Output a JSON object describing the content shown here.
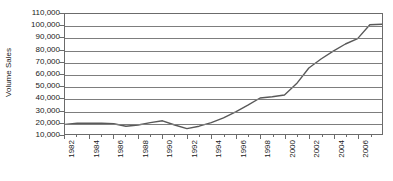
{
  "chart_data": {
    "type": "line",
    "title": "",
    "subtitle": "",
    "xlabel": "",
    "ylabel": "Volume Sales",
    "xlim": [
      1982,
      2008
    ],
    "ylim": [
      10000,
      110000
    ],
    "grid": true,
    "legend": false,
    "legend_position": "none",
    "line_color": "#595959",
    "gridline_color": "#7d7d7d",
    "axis_color": "#6b6b6b",
    "background_color": "#ffffff",
    "y_ticks": [
      "110,000",
      "100,000",
      "90,000",
      "80,000",
      "70,000",
      "60,000",
      "50,000",
      "40,000",
      "30,000",
      "20,000",
      "10,000"
    ],
    "y_tick_values": [
      110000,
      100000,
      90000,
      80000,
      70000,
      60000,
      50000,
      40000,
      30000,
      20000,
      10000
    ],
    "x_tick_labels": [
      "1982",
      "1984",
      "1986",
      "1988",
      "1990",
      "1992",
      "1994",
      "1996",
      "1998",
      "2000",
      "2002",
      "2004",
      "2006"
    ],
    "x_minor_years": [
      1983,
      1985,
      1987,
      1989,
      1991,
      1993,
      1995,
      1997,
      1999,
      2001,
      2003,
      2005,
      2007
    ],
    "x": [
      1982,
      1983,
      1984,
      1985,
      1986,
      1987,
      1988,
      1989,
      1990,
      1991,
      1992,
      1993,
      1994,
      1995,
      1996,
      1997,
      1998,
      1999,
      2000,
      2001,
      2002,
      2003,
      2004,
      2005,
      2006,
      2007,
      2008
    ],
    "values": [
      18000,
      19000,
      19000,
      19000,
      18500,
      16500,
      17500,
      19500,
      21000,
      17500,
      14500,
      16500,
      19500,
      23500,
      28500,
      34000,
      40000,
      41000,
      42500,
      52000,
      65000,
      72500,
      79000,
      85000,
      89500,
      101000,
      101500
    ],
    "series": [
      {
        "name": "Volume Sales",
        "values": [
          18000,
          19000,
          19000,
          19000,
          18500,
          16500,
          17500,
          19500,
          21000,
          17500,
          14500,
          16500,
          19500,
          23500,
          28500,
          34000,
          40000,
          41000,
          42500,
          52000,
          65000,
          72500,
          79000,
          85000,
          89500,
          101000,
          101500
        ]
      }
    ],
    "annotations": []
  }
}
